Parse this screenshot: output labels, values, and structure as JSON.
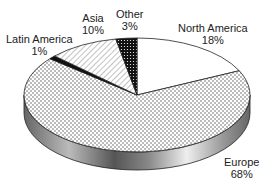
{
  "chart_data": {
    "type": "pie",
    "style": "3d",
    "title": "",
    "slices": [
      {
        "label": "North America",
        "value": 18,
        "pattern": "white"
      },
      {
        "label": "Europe",
        "value": 68,
        "pattern": "dots"
      },
      {
        "label": "Latin America",
        "value": 1,
        "pattern": "black"
      },
      {
        "label": "Asia",
        "value": 10,
        "pattern": "diagonal-hatch"
      },
      {
        "label": "Other",
        "value": 3,
        "pattern": "dark-dots"
      }
    ],
    "start_angle": "top",
    "direction": "clockwise"
  },
  "labels": {
    "north_america": {
      "name": "North America",
      "pct": "18%"
    },
    "europe": {
      "name": "Europe",
      "pct": "68%"
    },
    "latin_america": {
      "name": "Latin America",
      "pct": "1%"
    },
    "asia": {
      "name": "Asia",
      "pct": "10%"
    },
    "other": {
      "name": "Other",
      "pct": "3%"
    }
  }
}
